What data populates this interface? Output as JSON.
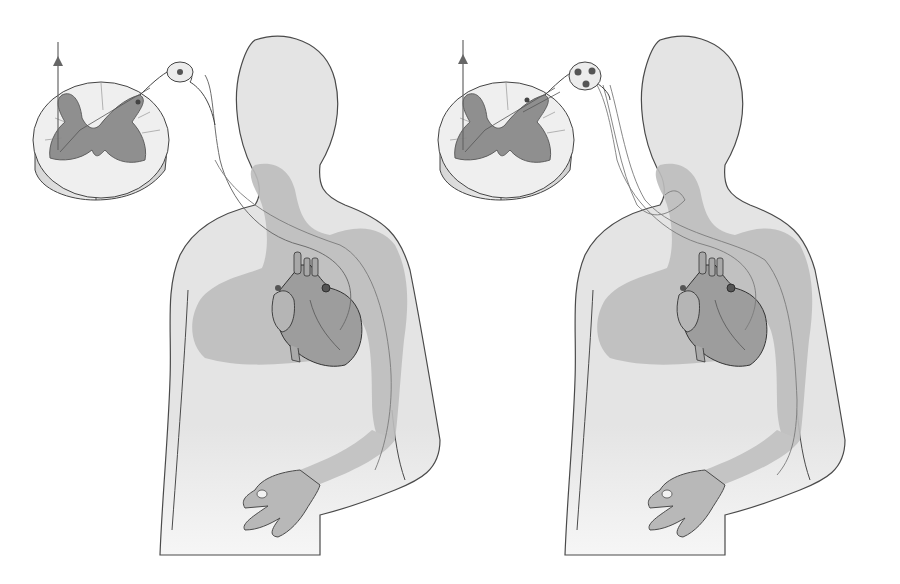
{
  "figure": {
    "colors": {
      "background": "#ffffff",
      "body_fill": "#e6e6e6",
      "referred_region": "#b9b9b9",
      "outline": "#444444",
      "gray_matter": "#8f8f8f",
      "white_matter": "#eeeeee",
      "heart": "#9a9a9a",
      "nerve": "#777777"
    },
    "panels": [
      {
        "id": "left",
        "variant": "single-neuron-pathway",
        "ganglion_cells": 1
      },
      {
        "id": "right",
        "variant": "converging-pathways",
        "ganglion_cells": 3
      }
    ]
  }
}
